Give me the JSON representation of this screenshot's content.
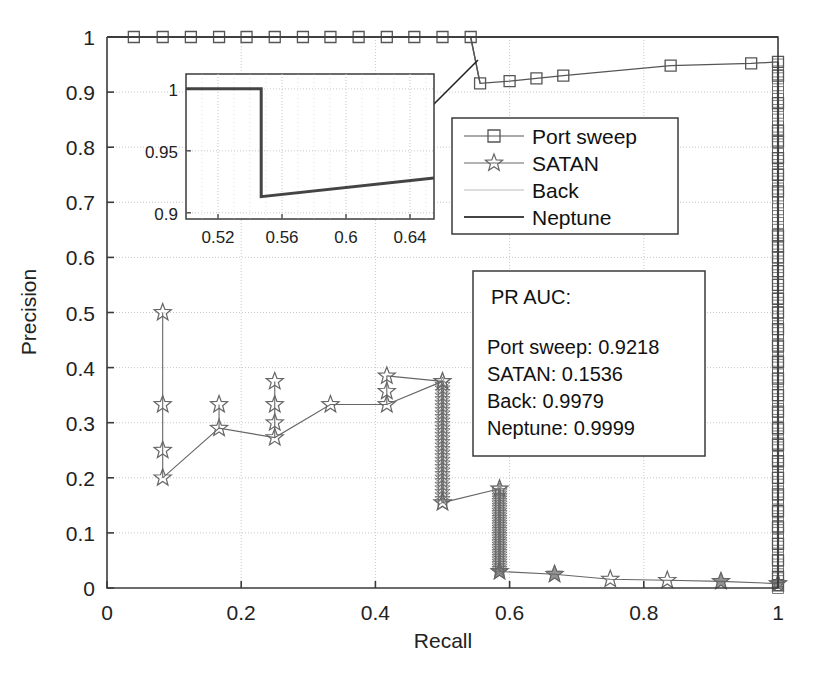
{
  "figure": {
    "width": 817,
    "height": 675,
    "background": "#ffffff"
  },
  "chart_data": {
    "type": "line",
    "title": "",
    "xlabel": "Recall",
    "ylabel": "Precision",
    "xlim": [
      0,
      1
    ],
    "ylim": [
      0,
      1
    ],
    "xticks": [
      "0",
      "0.2",
      "0.4",
      "0.6",
      "0.8",
      "1"
    ],
    "xtick_values": [
      0,
      0.2,
      0.4,
      0.6,
      0.8,
      1
    ],
    "yticks": [
      "0",
      "0.1",
      "0.2",
      "0.3",
      "0.4",
      "0.5",
      "0.6",
      "0.7",
      "0.8",
      "0.9",
      "1"
    ],
    "ytick_values": [
      0,
      0.1,
      0.2,
      0.3,
      0.4,
      0.5,
      0.6,
      0.7,
      0.8,
      0.9,
      1.0
    ],
    "grid": true,
    "legend_position": "upper-center-right",
    "series": [
      {
        "name": "Port sweep",
        "marker": "square",
        "color": "#555555",
        "points": [
          [
            0.04,
            1.0
          ],
          [
            0.083,
            1.0
          ],
          [
            0.125,
            1.0
          ],
          [
            0.167,
            1.0
          ],
          [
            0.208,
            1.0
          ],
          [
            0.25,
            1.0
          ],
          [
            0.292,
            1.0
          ],
          [
            0.333,
            1.0
          ],
          [
            0.375,
            1.0
          ],
          [
            0.417,
            1.0
          ],
          [
            0.458,
            1.0
          ],
          [
            0.5,
            1.0
          ],
          [
            0.542,
            1.0
          ],
          [
            0.556,
            0.916
          ],
          [
            0.6,
            0.92
          ],
          [
            0.64,
            0.925
          ],
          [
            0.68,
            0.93
          ],
          [
            0.84,
            0.948
          ],
          [
            0.96,
            0.952
          ],
          [
            1.0,
            0.955
          ],
          [
            1.0,
            0.93
          ],
          [
            1.0,
            0.88
          ],
          [
            1.0,
            0.83
          ],
          [
            1.0,
            0.81
          ],
          [
            1.0,
            0.78
          ],
          [
            1.0,
            0.75
          ],
          [
            1.0,
            0.72
          ],
          [
            1.0,
            0.64
          ],
          [
            1.0,
            0.62
          ],
          [
            1.0,
            0.6
          ],
          [
            1.0,
            0.575
          ],
          [
            1.0,
            0.55
          ],
          [
            1.0,
            0.525
          ],
          [
            1.0,
            0.5
          ],
          [
            1.0,
            0.47
          ],
          [
            1.0,
            0.44
          ],
          [
            1.0,
            0.41
          ],
          [
            1.0,
            0.38
          ],
          [
            1.0,
            0.35
          ],
          [
            1.0,
            0.32
          ],
          [
            1.0,
            0.29
          ],
          [
            1.0,
            0.26
          ],
          [
            1.0,
            0.23
          ],
          [
            1.0,
            0.2
          ],
          [
            1.0,
            0.17
          ],
          [
            1.0,
            0.14
          ],
          [
            1.0,
            0.11
          ],
          [
            1.0,
            0.08
          ],
          [
            1.0,
            0.05
          ],
          [
            1.0,
            0.02
          ],
          [
            1.0,
            0.005
          ]
        ]
      },
      {
        "name": "SATAN",
        "marker": "star",
        "color": "#666666",
        "points": [
          [
            0.083,
            0.5
          ],
          [
            0.083,
            0.333
          ],
          [
            0.083,
            0.25
          ],
          [
            0.083,
            0.2
          ],
          [
            0.167,
            0.333
          ],
          [
            0.167,
            0.29
          ],
          [
            0.25,
            0.375
          ],
          [
            0.25,
            0.333
          ],
          [
            0.25,
            0.3
          ],
          [
            0.25,
            0.273
          ],
          [
            0.333,
            0.333
          ],
          [
            0.417,
            0.385
          ],
          [
            0.417,
            0.357
          ],
          [
            0.417,
            0.333
          ],
          [
            0.5,
            0.375
          ],
          [
            0.5,
            0.155
          ],
          [
            0.585,
            0.18
          ],
          [
            0.585,
            0.03
          ],
          [
            0.667,
            0.025
          ],
          [
            0.75,
            0.016
          ],
          [
            0.835,
            0.014
          ],
          [
            0.915,
            0.012
          ],
          [
            1.0,
            0.008
          ]
        ],
        "dense_drops": [
          {
            "x": 0.5,
            "y_top": 0.375,
            "y_bottom": 0.155
          },
          {
            "x": 0.585,
            "y_top": 0.18,
            "y_bottom": 0.03
          }
        ]
      },
      {
        "name": "Back",
        "marker": "none",
        "color": "#bbbbbb",
        "points": [
          [
            0.0,
            1.0
          ],
          [
            1.0,
            1.0
          ]
        ]
      },
      {
        "name": "Neptune",
        "marker": "none",
        "color": "#444444",
        "points": [
          [
            0.0,
            1.0
          ],
          [
            1.0,
            1.0
          ]
        ]
      }
    ]
  },
  "legend": {
    "entries": [
      {
        "label": "Port sweep",
        "marker": "square",
        "line": true
      },
      {
        "label": "SATAN",
        "marker": "star",
        "line": true
      },
      {
        "label": "Back",
        "marker": "none",
        "line": true
      },
      {
        "label": "Neptune",
        "marker": "none",
        "line": true
      }
    ]
  },
  "auc_box": {
    "title": "PR AUC:",
    "rows": [
      "Port sweep: 0.9218",
      "SATAN: 0.1536",
      "Back: 0.9979",
      "Neptune: 0.9999"
    ]
  },
  "inset": {
    "xlim": [
      0.5,
      0.655
    ],
    "ylim": [
      0.895,
      1.012
    ],
    "xticks": [
      "0.52",
      "0.56",
      "0.6",
      "0.64"
    ],
    "xtick_values": [
      0.52,
      0.56,
      0.6,
      0.64
    ],
    "yticks": [
      "0.9",
      "0.95",
      "1"
    ],
    "ytick_values": [
      0.9,
      0.95,
      1.0
    ],
    "curve": [
      [
        0.5,
        1.0
      ],
      [
        0.547,
        1.0
      ],
      [
        0.547,
        0.913
      ],
      [
        0.655,
        0.928
      ]
    ],
    "line_color": "#444444"
  },
  "annotation": {
    "arrow": {
      "from_x": 478,
      "from_y": 60,
      "to_x": 412,
      "to_y": 126
    }
  },
  "colors": {
    "axis": "#3b3b3b",
    "grid": "#c9c9c9",
    "text": "#1a1a1a",
    "port_sweep": "#555555",
    "satan": "#666666",
    "back": "#bbbbbb",
    "neptune": "#444444"
  }
}
